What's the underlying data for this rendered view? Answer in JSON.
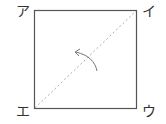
{
  "diagram": {
    "corners": {
      "top_left": "ア",
      "top_right": "イ",
      "bottom_right": "ウ",
      "bottom_left": "エ"
    },
    "fold_line": "diagonal from エ to イ (dotted)",
    "arrow": "curved fold arrow",
    "colors": {
      "square": "#555555",
      "fold_line": "#aaaaaa",
      "arrow": "#777777"
    }
  }
}
